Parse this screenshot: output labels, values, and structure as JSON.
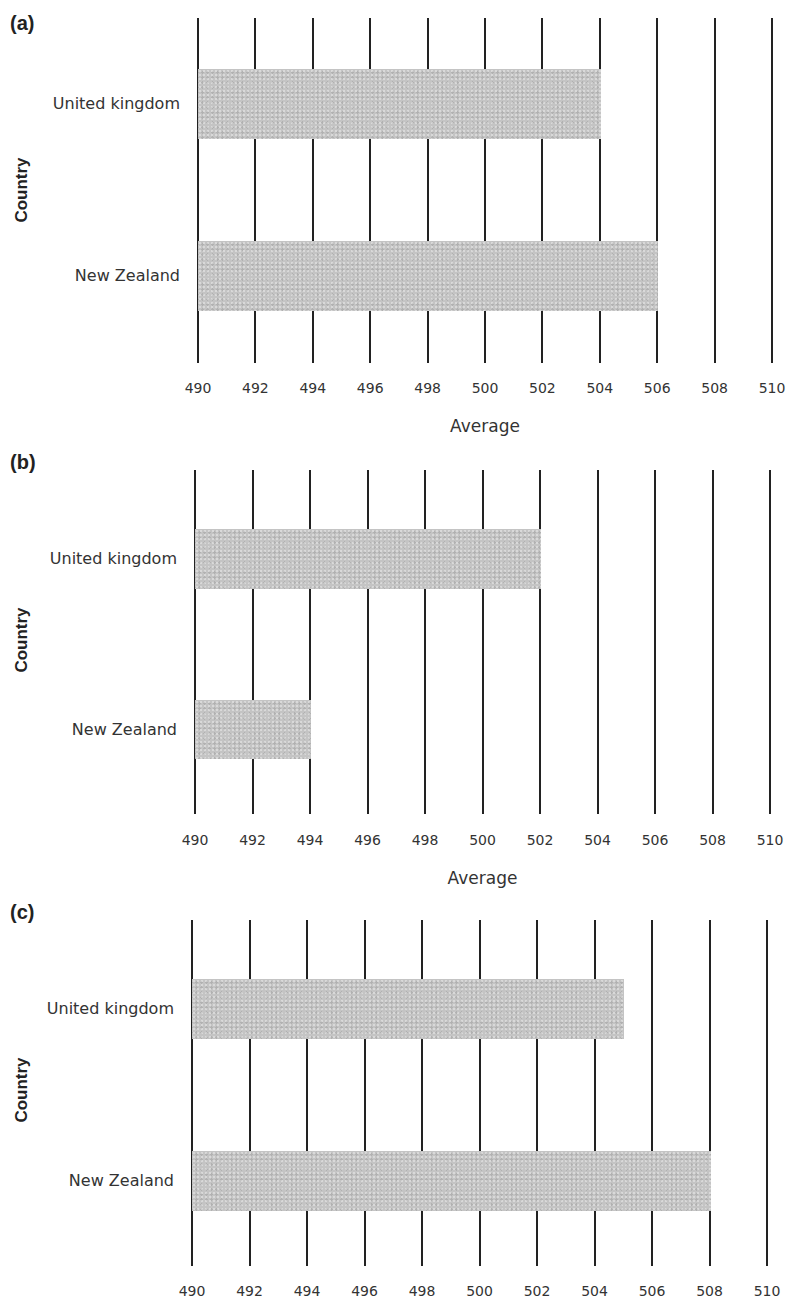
{
  "chart_data": [
    {
      "panel": "(a)",
      "type": "bar",
      "orientation": "horizontal",
      "categories": [
        "United kingdom",
        "New Zealand"
      ],
      "values": [
        504,
        506
      ],
      "xlabel": "Average",
      "ylabel": "Country",
      "xlim": [
        490,
        510
      ],
      "xticks": [
        490,
        492,
        494,
        496,
        498,
        500,
        502,
        504,
        506,
        508,
        510
      ],
      "grid": "vertical",
      "bar_color": "#c4c4c4"
    },
    {
      "panel": "(b)",
      "type": "bar",
      "orientation": "horizontal",
      "categories": [
        "United kingdom",
        "New Zealand"
      ],
      "values": [
        502,
        494
      ],
      "xlabel": "Average",
      "ylabel": "Country",
      "xlim": [
        490,
        510
      ],
      "xticks": [
        490,
        492,
        494,
        496,
        498,
        500,
        502,
        504,
        506,
        508,
        510
      ],
      "grid": "vertical",
      "bar_color": "#c4c4c4"
    },
    {
      "panel": "(c)",
      "type": "bar",
      "orientation": "horizontal",
      "categories": [
        "United kingdom",
        "New Zealand"
      ],
      "values": [
        505,
        508
      ],
      "xlabel": "",
      "ylabel": "Country",
      "xlim": [
        490,
        510
      ],
      "xticks": [
        490,
        492,
        494,
        496,
        498,
        500,
        502,
        504,
        506,
        508,
        510
      ],
      "grid": "vertical",
      "bar_color": "#c4c4c4"
    }
  ],
  "panels": [
    {
      "label": "(a)",
      "ylabel": "Country",
      "xlabel": "Average",
      "categories": [
        "United kingdom",
        "New Zealand"
      ],
      "ticks": [
        "490",
        "492",
        "494",
        "496",
        "498",
        "500",
        "502",
        "504",
        "506",
        "508",
        "510"
      ]
    },
    {
      "label": "(b)",
      "ylabel": "Country",
      "xlabel": "Average",
      "categories": [
        "United kingdom",
        "New Zealand"
      ],
      "ticks": [
        "490",
        "492",
        "494",
        "496",
        "498",
        "500",
        "502",
        "504",
        "506",
        "508",
        "510"
      ]
    },
    {
      "label": "(c)",
      "ylabel": "Country",
      "categories": [
        "United kingdom",
        "New Zealand"
      ],
      "ticks": [
        "490",
        "492",
        "494",
        "496",
        "498",
        "500",
        "502",
        "504",
        "506",
        "508",
        "510"
      ]
    }
  ]
}
